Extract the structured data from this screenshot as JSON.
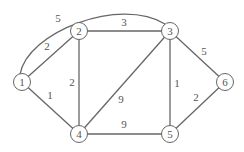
{
  "diagram": {
    "type": "weighted-undirected-graph",
    "colors": {
      "stroke": "#666666",
      "node_fill": "#ffffff",
      "text": "#555555"
    },
    "nodes": [
      {
        "id": "1",
        "label": "1",
        "x": 22,
        "y": 82
      },
      {
        "id": "2",
        "label": "2",
        "x": 79,
        "y": 31
      },
      {
        "id": "3",
        "label": "3",
        "x": 170,
        "y": 31
      },
      {
        "id": "4",
        "label": "4",
        "x": 79,
        "y": 134
      },
      {
        "id": "5",
        "label": "5",
        "x": 170,
        "y": 134
      },
      {
        "id": "6",
        "label": "6",
        "x": 225,
        "y": 82
      }
    ],
    "edges": [
      {
        "from": "1",
        "to": "3",
        "weight": "5",
        "curved": true,
        "label_x": 58,
        "label_y": 22
      },
      {
        "from": "1",
        "to": "2",
        "weight": "2",
        "label_x": 47,
        "label_y": 50
      },
      {
        "from": "1",
        "to": "4",
        "weight": "1",
        "label_x": 50,
        "label_y": 99
      },
      {
        "from": "2",
        "to": "3",
        "weight": "3",
        "label_x": 124,
        "label_y": 26
      },
      {
        "from": "2",
        "to": "4",
        "weight": "2",
        "label_x": 72,
        "label_y": 86
      },
      {
        "from": "3",
        "to": "4",
        "weight": "9",
        "label_x": 121,
        "label_y": 103
      },
      {
        "from": "3",
        "to": "5",
        "weight": "1",
        "label_x": 177,
        "label_y": 87
      },
      {
        "from": "3",
        "to": "6",
        "weight": "5",
        "label_x": 204,
        "label_y": 55
      },
      {
        "from": "4",
        "to": "5",
        "weight": "9",
        "label_x": 124,
        "label_y": 128
      },
      {
        "from": "5",
        "to": "6",
        "weight": "2",
        "label_x": 196,
        "label_y": 101
      }
    ]
  }
}
